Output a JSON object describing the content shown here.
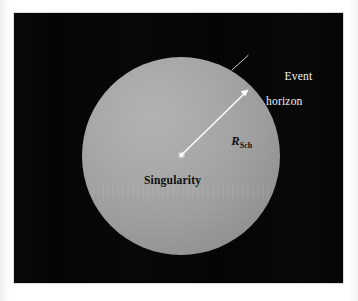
{
  "figure": {
    "kind": "schwarzschild-black-hole-diagram",
    "background_color": "#ffffff",
    "plate_color": "#050505",
    "sphere": {
      "fill_light": "#b2b2b2",
      "fill_dark": "#7e7e7e",
      "center_x": 181,
      "center_y": 155,
      "radius": 99
    }
  },
  "labels": {
    "event_horizon_line1": "Event",
    "event_horizon_line2": "horizon",
    "singularity": "Singularity",
    "radius_symbol": "R",
    "radius_subscript": "Sch"
  },
  "annotations": {
    "arrow_color": "#ffffff",
    "leader_color": "#e6e6e6",
    "singularity_dot_color": "#ffffff",
    "arrow_from": "singularity",
    "arrow_to": "event-horizon",
    "leader_from": "event-horizon-label",
    "leader_to": "sphere-edge"
  }
}
